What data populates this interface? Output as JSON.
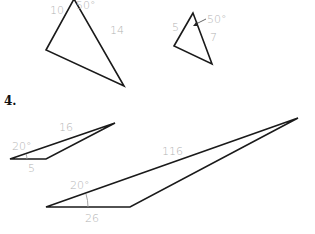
{
  "problem_number": "4.",
  "figures": {
    "triangle_a": {
      "side_left": "10",
      "angle_top": "50°",
      "side_right": "14"
    },
    "triangle_b": {
      "side_left": "5",
      "angle_top": "50°",
      "side_right": "7"
    },
    "triangle_c": {
      "angle_left": "20°",
      "side_long": "16",
      "side_base": "5"
    },
    "triangle_d": {
      "angle_left": "20°",
      "side_long": "116",
      "side_base": "26"
    }
  },
  "colors": {
    "stroke": "#1a1a1a",
    "label": "#b3b3b3"
  }
}
